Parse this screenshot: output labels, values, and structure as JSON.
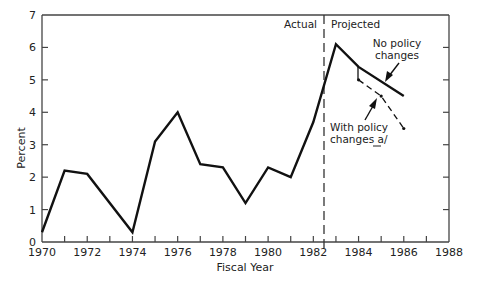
{
  "chart_data": {
    "type": "line",
    "title": "",
    "xlabel": "Fiscal Year",
    "ylabel": "Percent",
    "xlim": [
      1970,
      1988
    ],
    "ylim": [
      0,
      7
    ],
    "x_ticks": [
      1970,
      1972,
      1974,
      1976,
      1978,
      1980,
      1982,
      1984,
      1986,
      1988
    ],
    "y_ticks": [
      0,
      1,
      2,
      3,
      4,
      5,
      6,
      7
    ],
    "grid": false,
    "divider": {
      "x": 1982.5,
      "style": "dashed",
      "left_label": "Actual",
      "right_label": "Projected"
    },
    "series": [
      {
        "name": "Actual / No policy changes",
        "style": "solid",
        "x": [
          1970,
          1971,
          1972,
          1974,
          1975,
          1976,
          1977,
          1978,
          1979,
          1980,
          1981,
          1982,
          1983,
          1984,
          1986
        ],
        "values": [
          0.3,
          2.2,
          2.1,
          0.3,
          3.1,
          4.0,
          2.4,
          2.3,
          1.2,
          2.3,
          2.0,
          3.7,
          6.1,
          5.4,
          4.5
        ]
      },
      {
        "name": "With policy changes a/",
        "style": "dashed",
        "x": [
          1984,
          1985,
          1986
        ],
        "values": [
          5.0,
          4.5,
          3.5
        ]
      }
    ],
    "annotations": [
      {
        "text_lines": [
          "No policy",
          "changes"
        ],
        "points_to": "solid projected line"
      },
      {
        "text_lines": [
          "With policy",
          "changes a/"
        ],
        "points_to": "dashed projected line"
      }
    ]
  },
  "labels": {
    "xlabel": "Fiscal Year",
    "ylabel": "Percent",
    "actual": "Actual",
    "projected": "Projected",
    "no_policy_1": "No policy",
    "no_policy_2": "changes",
    "with_policy_1": "With policy",
    "with_policy_2": "changes a/"
  }
}
